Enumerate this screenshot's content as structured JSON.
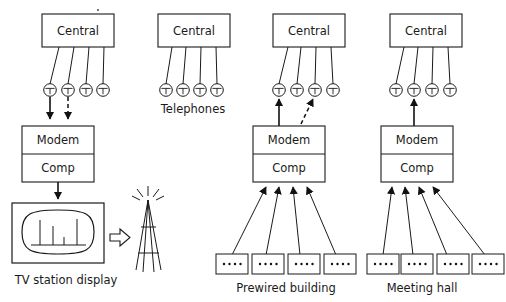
{
  "figure": {
    "type": "technical-block-diagram",
    "background_color": "#ffffff",
    "line_color": "#1a1a1a"
  },
  "common": {
    "central_label": "Central",
    "modem_label": "Modem",
    "computer_label": "Comp",
    "telephone_icon_name": "telephone-icon",
    "telephone_glyph": "T",
    "terminal_dot_count": 4
  },
  "columns": [
    {
      "id": "tv-station",
      "caption": "TV station display",
      "central_label": "Central",
      "telephone_count": 4,
      "modem_label": "Modem",
      "computer_label": "Comp",
      "link_direction": "down-into-modem",
      "links": [
        {
          "from_phone": 1,
          "style": "solid",
          "direction": "down"
        },
        {
          "from_phone": 2,
          "style": "dashed",
          "direction": "down"
        }
      ],
      "output_device": "tv-display",
      "has_tower": true,
      "spectrum_bars": [
        {
          "index": 1,
          "height": 0.95
        },
        {
          "index": 2,
          "height": 0.7
        },
        {
          "index": 3,
          "height": 0.3
        },
        {
          "index": 4,
          "height": 1.0
        }
      ]
    },
    {
      "id": "telephones",
      "caption": "Telephones",
      "central_label": "Central",
      "telephone_count": 4,
      "modem_label": null,
      "computer_label": null,
      "links": [],
      "output_device": "none",
      "has_tower": false
    },
    {
      "id": "prewired-building",
      "caption": "Prewired building",
      "central_label": "Central",
      "telephone_count": 4,
      "modem_label": "Modem",
      "computer_label": "Comp",
      "link_direction": "up-from-modem",
      "links": [
        {
          "from_phone": 1,
          "style": "solid",
          "direction": "up"
        },
        {
          "from_phone": 3,
          "style": "dashed",
          "direction": "up"
        }
      ],
      "terminal_count": 4,
      "terminal_dots": 4,
      "output_device": "terminals",
      "has_tower": false
    },
    {
      "id": "meeting-hall",
      "caption": "Meeting hall",
      "central_label": "Central",
      "telephone_count": 4,
      "modem_label": "Modem",
      "computer_label": "Comp",
      "link_direction": "up-from-modem",
      "links": [
        {
          "from_phone": 2,
          "style": "solid",
          "direction": "up"
        }
      ],
      "terminal_count": 4,
      "terminal_dots": 4,
      "output_device": "terminals",
      "has_tower": false
    }
  ],
  "captions": {
    "col1": "TV station display",
    "col2": "Telephones",
    "col3": "Prewired building",
    "col4": "Meeting hall"
  },
  "labels": {
    "central_1": "Central",
    "central_2": "Central",
    "central_3": "Central",
    "central_4": "Central",
    "modem_1": "Modem",
    "comp_1": "Comp",
    "modem_3": "Modem",
    "comp_3": "Comp",
    "modem_4": "Modem",
    "comp_4": "Comp",
    "phone_glyph": "T"
  }
}
